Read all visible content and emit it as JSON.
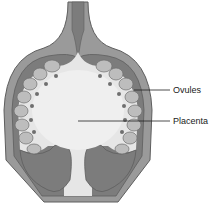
{
  "diagram": {
    "colors": {
      "wall_outer": "#9a9a9a",
      "wall_edge": "#5e5e5e",
      "wall_dark": "#7c7c7c",
      "cavity": "#e6e6e6",
      "placenta": "#efefef",
      "ovule_fill": "#bdbdbd",
      "ovule_stalk": "#6f6f6f",
      "leader_line": "#222222",
      "background": "#ffffff"
    },
    "labels": [
      {
        "id": "ovules",
        "text": "Ovules"
      },
      {
        "id": "placenta",
        "text": "Placenta"
      }
    ]
  }
}
